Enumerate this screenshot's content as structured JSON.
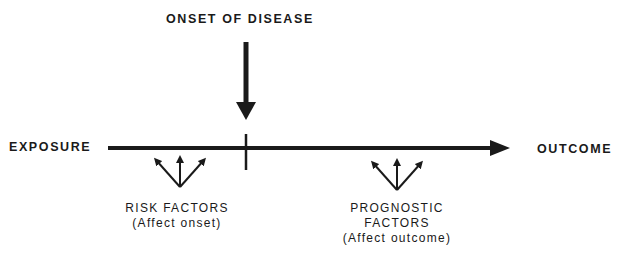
{
  "diagram": {
    "title_top": "ONSET OF DISEASE",
    "left_label": "EXPOSURE",
    "right_label": "OUTCOME",
    "risk_factors": {
      "line1": "RISK FACTORS",
      "line2": "(Affect onset)"
    },
    "prognostic_factors": {
      "line1": "PROGNOSTIC",
      "line2": "FACTORS",
      "line3": "(Affect outcome)"
    },
    "colors": {
      "ink": "#1a1a1a",
      "background": "#ffffff"
    }
  }
}
